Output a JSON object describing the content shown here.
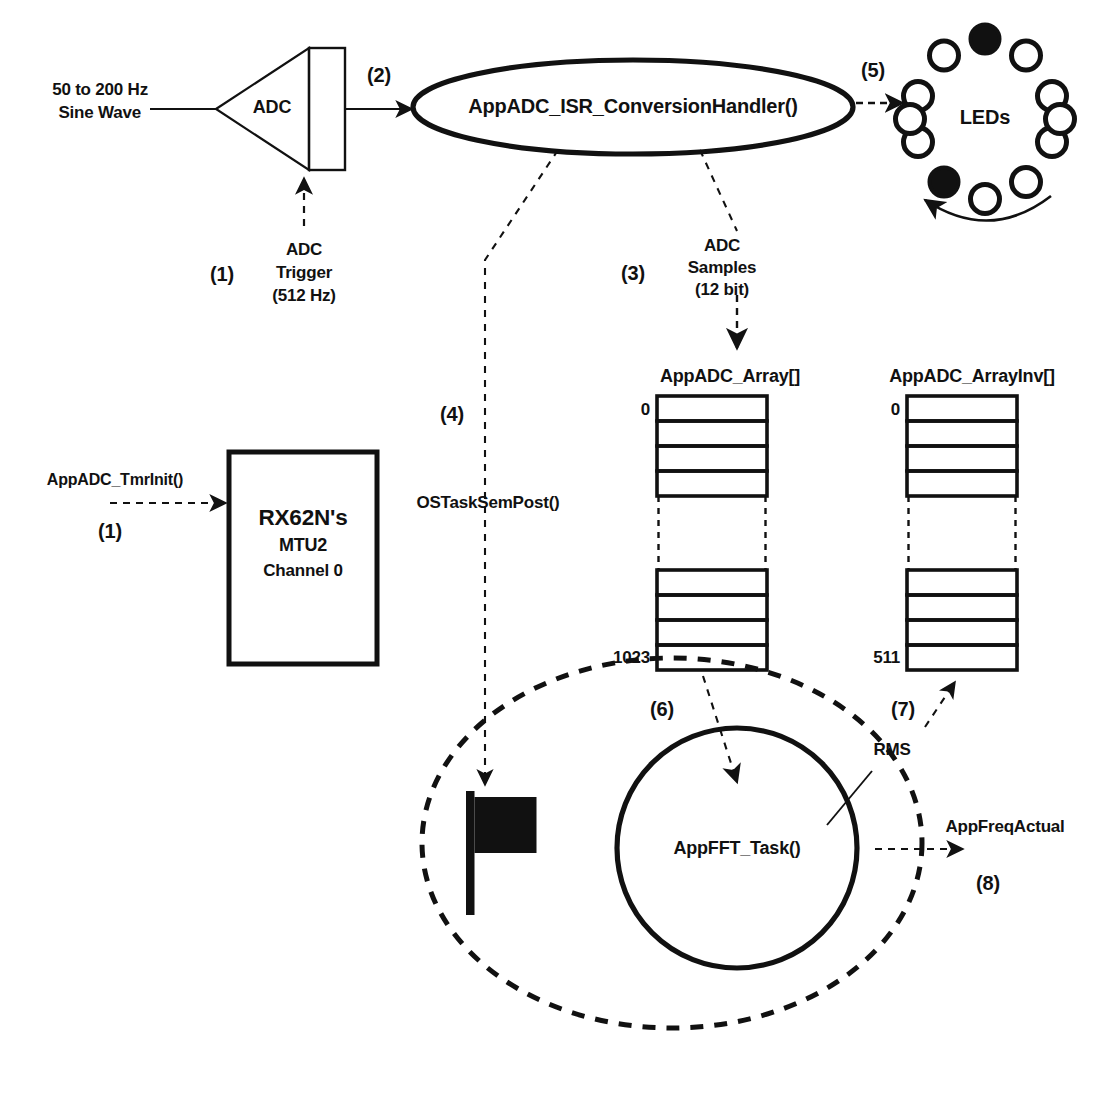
{
  "diagram": {
    "colors": {
      "ink": "#111111",
      "background": "#ffffff"
    }
  },
  "signal_source": {
    "line1": "50 to 200 Hz",
    "line2": "Sine Wave"
  },
  "adc_block": {
    "label": "ADC",
    "output_step": "(2)"
  },
  "adc_trigger": {
    "step": "(1)",
    "line1": "ADC",
    "line2": "Trigger",
    "line3": "(512 Hz)"
  },
  "timer_block": {
    "line1": "RX62N's",
    "line2": "MTU2",
    "line3": "Channel 0",
    "init_call": "AppADC_TmrInit()",
    "init_step": "(1)"
  },
  "isr": {
    "label": "AppADC_ISR_ConversionHandler()"
  },
  "leds": {
    "label": "LEDs",
    "step": "(5)",
    "count": 12,
    "lit_positions": [
      0,
      6
    ]
  },
  "adc_samples": {
    "step": "(3)",
    "line1": "ADC",
    "line2": "Samples",
    "line3": "(12 bit)"
  },
  "sem_post": {
    "label": "OSTaskSemPost()",
    "step": "(4)"
  },
  "array_main": {
    "name": "AppADC_Array[]",
    "first_index": "0",
    "last_index": "1023",
    "top_cells": 4,
    "bottom_cells": 4
  },
  "array_inv": {
    "name": "AppADC_ArrayInv[]",
    "first_index": "0",
    "last_index": "511",
    "top_cells": 4,
    "bottom_cells": 4
  },
  "fft_task": {
    "label": "AppFFT_Task()",
    "input_step": "(6)",
    "rms_label": "RMS",
    "rms_step": "(7)",
    "output_label": "AppFreqActual",
    "output_step": "(8)"
  }
}
